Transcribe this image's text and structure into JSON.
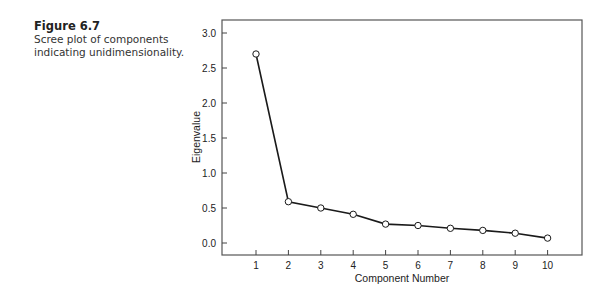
{
  "figure": {
    "number": "Figure 6.7",
    "caption": "Scree plot of components indicating unidimensionality."
  },
  "chart_data": {
    "type": "line",
    "title": "",
    "xlabel": "Component Number",
    "ylabel": "Eigenvalue",
    "x": [
      1,
      2,
      3,
      4,
      5,
      6,
      7,
      8,
      9,
      10
    ],
    "series": [
      {
        "name": "Eigenvalue",
        "values": [
          2.7,
          0.59,
          0.5,
          0.41,
          0.27,
          0.25,
          0.21,
          0.18,
          0.14,
          0.07
        ]
      }
    ],
    "x_ticks": [
      "1",
      "2",
      "3",
      "4",
      "5",
      "6",
      "7",
      "8",
      "9",
      "10"
    ],
    "y_ticks": [
      "0.0",
      "0.5",
      "1.0",
      "1.5",
      "2.0",
      "2.5",
      "3.0"
    ],
    "ylim": [
      -0.17,
      3.2
    ],
    "xlim": [
      -0.2,
      11.1
    ],
    "grid": false,
    "legend": "none",
    "marker": "open-circle",
    "line_color": "#1a1a1a"
  }
}
